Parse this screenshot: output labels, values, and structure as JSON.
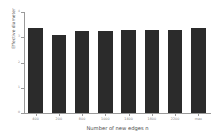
{
  "chart_data": {
    "type": "bar",
    "title": "",
    "xlabel": "Number of new edges n",
    "ylabel": "Effective diameter",
    "categories": [
      "400",
      "200",
      "800",
      "1000",
      "1400",
      "1800",
      "2200",
      "max"
    ],
    "values": [
      3.38,
      3.08,
      3.23,
      3.25,
      3.27,
      3.28,
      3.3,
      3.35
    ],
    "ylim": [
      0,
      4
    ],
    "yticks": [
      "0",
      "1",
      "2",
      "3",
      "4"
    ],
    "ytick_values": [
      0,
      1,
      2,
      3,
      4
    ],
    "grid": false,
    "legend": null,
    "bar_color": "#2b2b2b",
    "axis_color": "#9a9a9a",
    "background": "#ffffff"
  }
}
